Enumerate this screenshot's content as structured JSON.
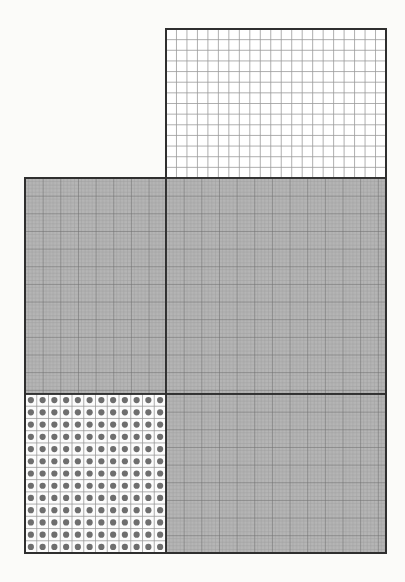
{
  "figure": {
    "canvas": {
      "width": 405,
      "height": 582
    },
    "background_color": "#fbfbf9",
    "colors": {
      "background": "#fbfbf9",
      "shaded_fill": "#b5b5b5",
      "unshaded_fill": "#ffffff",
      "fine_grid_line": "#9a9a9a",
      "major_grid_line": "#6e6e6e",
      "outline": "#2f2f2f",
      "dot_fill": "#6e6e6e",
      "dot_cell_fill": "#fcfcfc"
    }
  },
  "chart_data": {
    "type": "table",
    "xlabel": "",
    "ylabel": "",
    "grid": "on",
    "legend_position": "none",
    "panels": [
      {
        "name": "upper-right-open-grid",
        "label": "Upper right panel",
        "fill": "unshaded",
        "fill_color": "#ffffff",
        "x": 166,
        "y": 29,
        "width": 220,
        "height": 149,
        "columns": 21,
        "rows": 14,
        "cell_width": 10.476,
        "cell_height": 10.643,
        "cell_count": 294,
        "dotted": false,
        "grid_style": "coarse"
      },
      {
        "name": "middle-left-shaded-grid",
        "label": "Middle left panel",
        "fill": "shaded",
        "fill_color": "#b5b5b5",
        "x": 25,
        "y": 178,
        "width": 141,
        "height": 216,
        "minor_cell": 3.53,
        "major_every": 5,
        "columns": 40,
        "rows": 61,
        "dotted": false,
        "grid_style": "fine"
      },
      {
        "name": "right-shaded-grid",
        "label": "Right shaded panel",
        "fill": "shaded",
        "fill_color": "#b5b5b5",
        "x": 166,
        "y": 178,
        "width": 220,
        "height": 216,
        "minor_cell": 3.53,
        "major_every": 5,
        "columns": 62,
        "rows": 61,
        "dotted": false,
        "grid_style": "fine"
      },
      {
        "name": "lower-right-shaded-grid",
        "label": "Lower right shaded panel",
        "fill": "shaded",
        "fill_color": "#b5b5b5",
        "x": 166,
        "y": 394,
        "width": 220,
        "height": 159,
        "minor_cell": 3.53,
        "major_every": 5,
        "columns": 62,
        "rows": 45,
        "dotted": false,
        "grid_style": "fine"
      },
      {
        "name": "lower-left-dotted-grid",
        "label": "Lower left dotted panel",
        "fill": "unshaded",
        "fill_color": "#fcfcfc",
        "x": 25,
        "y": 394,
        "width": 141,
        "height": 159,
        "columns": 12,
        "rows": 13,
        "cell_width": 11.75,
        "cell_height": 12.23,
        "cell_count": 156,
        "dot_count": 156,
        "dot_radius": 3.1,
        "dotted": true,
        "grid_style": "coarse"
      }
    ],
    "dividers": [
      {
        "name": "vertical-divider",
        "orientation": "vertical",
        "x": 166,
        "y1": 178,
        "y2": 553
      },
      {
        "name": "horizontal-divider",
        "orientation": "horizontal",
        "y": 394,
        "x1": 25,
        "x2": 386
      },
      {
        "name": "upper-shelf-divider",
        "orientation": "horizontal",
        "y": 178,
        "x1": 25,
        "x2": 386
      }
    ],
    "outline": {
      "name": "figure-outline",
      "points": "166,29 386,29 386,553 25,553 25,178 166,178"
    }
  }
}
